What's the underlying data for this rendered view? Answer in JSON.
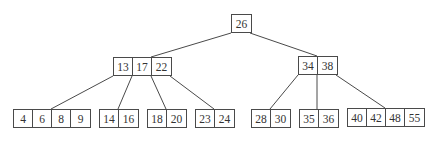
{
  "diagram": {
    "type": "b-tree",
    "colors": {
      "line": "#4a4a4a",
      "text": "#333333",
      "background": "#ffffff"
    },
    "nodes": [
      {
        "id": "root",
        "keys": [
          "26"
        ],
        "x": 231,
        "y": 14
      },
      {
        "id": "n-left",
        "keys": [
          "13",
          "17",
          "22"
        ],
        "x": 113,
        "y": 57
      },
      {
        "id": "n-right",
        "keys": [
          "34",
          "38"
        ],
        "x": 298,
        "y": 56
      },
      {
        "id": "leaf-1",
        "keys": [
          "4",
          "6",
          "8",
          "9"
        ],
        "x": 13,
        "y": 109
      },
      {
        "id": "leaf-2",
        "keys": [
          "14",
          "16"
        ],
        "x": 99,
        "y": 109
      },
      {
        "id": "leaf-3",
        "keys": [
          "18",
          "20"
        ],
        "x": 147,
        "y": 109
      },
      {
        "id": "leaf-4",
        "keys": [
          "23",
          "24"
        ],
        "x": 195,
        "y": 109
      },
      {
        "id": "leaf-5",
        "keys": [
          "28",
          "30"
        ],
        "x": 251,
        "y": 109
      },
      {
        "id": "leaf-6",
        "keys": [
          "35",
          "36"
        ],
        "x": 299,
        "y": 109
      },
      {
        "id": "leaf-7",
        "keys": [
          "40",
          "42",
          "48",
          "55"
        ],
        "x": 347,
        "y": 108
      }
    ],
    "edges": [
      {
        "from": [
          231,
          33
        ],
        "to": [
          151,
          57
        ]
      },
      {
        "from": [
          250,
          33
        ],
        "to": [
          317,
          56
        ]
      },
      {
        "from": [
          113,
          76
        ],
        "to": [
          51,
          109
        ]
      },
      {
        "from": [
          132,
          76
        ],
        "to": [
          118,
          109
        ]
      },
      {
        "from": [
          151,
          76
        ],
        "to": [
          166,
          109
        ]
      },
      {
        "from": [
          170,
          76
        ],
        "to": [
          214,
          109
        ]
      },
      {
        "from": [
          298,
          75
        ],
        "to": [
          270,
          109
        ]
      },
      {
        "from": [
          317,
          75
        ],
        "to": [
          317,
          109
        ]
      },
      {
        "from": [
          336,
          75
        ],
        "to": [
          385,
          108
        ]
      }
    ]
  }
}
